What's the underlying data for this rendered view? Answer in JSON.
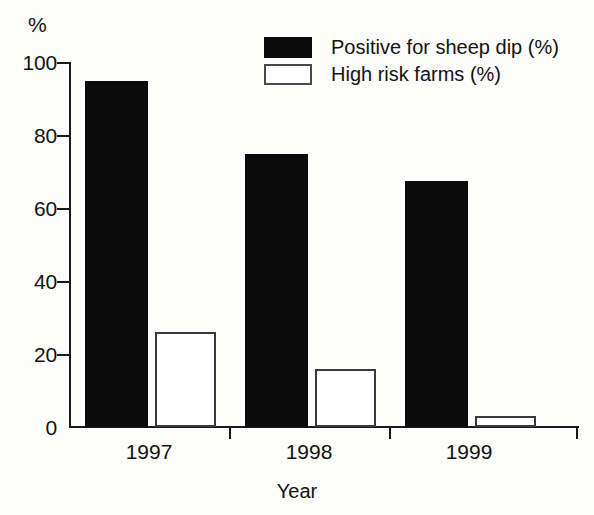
{
  "chart_data": {
    "type": "bar",
    "title": "",
    "xlabel": "Year",
    "ylabel": "%",
    "ylim": [
      0,
      100
    ],
    "yticks": [
      0,
      20,
      40,
      60,
      80,
      100
    ],
    "grid": false,
    "legend_position": "top-right",
    "categories": [
      "1997",
      "1998",
      "1999"
    ],
    "series": [
      {
        "name": "Positive for sheep dip (%)",
        "style": "solid-black",
        "color": "#0b0b0b",
        "values": [
          95,
          75,
          67.5
        ]
      },
      {
        "name": "High risk farms (%)",
        "style": "hollow-outline",
        "color": "#ffffff",
        "values": [
          26,
          16,
          3
        ]
      }
    ]
  },
  "axis": {
    "unit_label": "%",
    "x_title": "Year",
    "tick_labels": {
      "t0": "0",
      "t20": "20",
      "t40": "40",
      "t60": "60",
      "t80": "80",
      "t100": "100"
    },
    "category_labels": {
      "c0": "1997",
      "c1": "1998",
      "c2": "1999"
    }
  },
  "legend": {
    "entries": [
      {
        "label": "Positive for sheep dip (%)"
      },
      {
        "label": "High risk farms (%)"
      }
    ]
  }
}
